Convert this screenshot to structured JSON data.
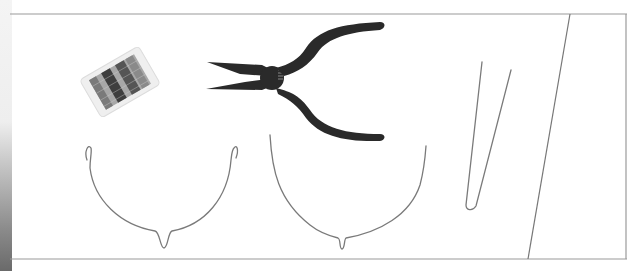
{
  "image": {
    "description": "Jewelry-making supplies on a white page: a spool of silver wire, needle-nose pliers, two U-shaped wire forms with small bottom loops, and a narrow V-shaped wire piece, framed by thin gray border lines with a diagonal divider on the right.",
    "objects": [
      {
        "name": "wire-spool",
        "label": "Spool of silver craft wire"
      },
      {
        "name": "needle-nose-pliers",
        "label": "Needle-nose pliers with dark handles"
      },
      {
        "name": "wire-form-left",
        "label": "U-shaped wire form with curled tips and bottom loop"
      },
      {
        "name": "wire-form-middle",
        "label": "Larger U-shaped wire form with bottom loop"
      },
      {
        "name": "wire-form-v",
        "label": "Narrow V-shaped wire piece"
      }
    ],
    "colors": {
      "background": "#ffffff",
      "frame_line": "#9a9a9a",
      "wire": "#7a7a7a",
      "pliers": "#2a2a2a",
      "spool_wire": "#5a5a5a"
    }
  }
}
